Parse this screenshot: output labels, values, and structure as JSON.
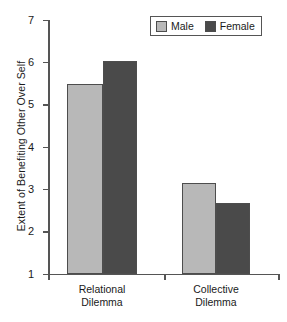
{
  "chart_data": {
    "type": "bar",
    "title": "",
    "xlabel": "",
    "ylabel": "Extent of Benefiting Other Over Self",
    "categories": [
      "Relational Dilemma",
      "Collective Dilemma"
    ],
    "category_lines": [
      [
        "Relational",
        "Dilemma"
      ],
      [
        "Collective",
        "Dilemma"
      ]
    ],
    "series": [
      {
        "name": "Male",
        "values": [
          5.47,
          3.15
        ],
        "color": "#b8b8b8"
      },
      {
        "name": "Female",
        "values": [
          6.02,
          2.66
        ],
        "color": "#4a4a4a"
      }
    ],
    "ylim": [
      1,
      7
    ],
    "ytick_labels": [
      "1",
      "2",
      "3",
      "4",
      "5",
      "6",
      "7"
    ],
    "ytick_values": [
      1,
      2,
      3,
      4,
      5,
      6,
      7
    ],
    "grid": false,
    "legend_position": "top-right",
    "bar_border_color": "#4d4d4d",
    "axis_color": "#555555"
  },
  "legend": {
    "items": [
      {
        "label": "Male",
        "swatch_name": "legend-swatch-male"
      },
      {
        "label": "Female",
        "swatch_name": "legend-swatch-female"
      }
    ]
  }
}
